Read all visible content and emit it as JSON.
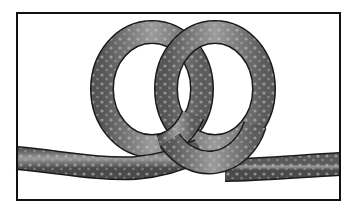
{
  "figure": {
    "caption": "",
    "colors": {
      "background": "#ffffff",
      "frame": "#111111",
      "rope_dark": "#4a4a4a",
      "rope_mid": "#7c7c7c",
      "rope_light": "#b4b4b4",
      "rope_outline": "#1a1a1a"
    },
    "frame": {
      "x": 17,
      "y": 13,
      "width": 323,
      "height": 187
    },
    "elements": [
      {
        "id": "left-loop",
        "cx": 152,
        "cy": 89,
        "rx": 50,
        "ry": 57
      },
      {
        "id": "right-loop",
        "cx": 215,
        "cy": 89,
        "rx": 49,
        "ry": 57
      },
      {
        "id": "left-standing-end",
        "from": [
          17,
          158
        ],
        "to": [
          175,
          172
        ]
      },
      {
        "id": "right-working-end",
        "from": [
          230,
          172
        ],
        "to": [
          340,
          165
        ]
      }
    ],
    "rope_width": 22
  }
}
